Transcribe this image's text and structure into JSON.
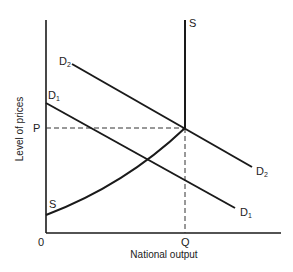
{
  "diagram": {
    "type": "aggregate supply and demand",
    "y_axis_label": "Level of prices",
    "x_axis_label": "National output",
    "origin_label": "0",
    "price_label": "P",
    "quantity_label": "Q",
    "curves": {
      "supply_top_label": "S",
      "supply_bottom_label": "S",
      "d1_start_label": "D",
      "d1_start_sub": "1",
      "d1_end_label": "D",
      "d1_end_sub": "1",
      "d2_start_label": "D",
      "d2_start_sub": "2",
      "d2_end_label": "D",
      "d2_end_sub": "2"
    },
    "colors": {
      "line": "#1a1a1a",
      "text": "#222222",
      "background": "#ffffff"
    }
  }
}
